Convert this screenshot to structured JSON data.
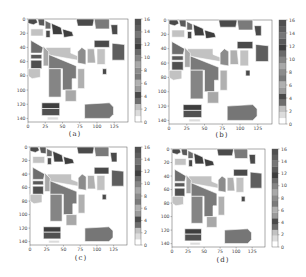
{
  "chart_data": [
    {
      "type": "heatmap",
      "title": "",
      "caption": "(a)",
      "xlabel": "",
      "ylabel": "",
      "x_ticks": [
        "0",
        "25",
        "50",
        "75",
        "100",
        "125"
      ],
      "y_ticks": [
        "0",
        "20",
        "40",
        "60",
        "80",
        "100",
        "120",
        "140"
      ],
      "xlim": [
        0,
        145
      ],
      "ylim": [
        145,
        0
      ],
      "colorbar": {
        "min": 0,
        "max": 16,
        "ticks": [
          "0",
          "2",
          "4",
          "6",
          "8",
          "10",
          "12",
          "14",
          "16"
        ]
      },
      "description": "Classification map, 145x145 pixels, 17 classes (0 = background)"
    },
    {
      "type": "heatmap",
      "caption": "(b)",
      "x_ticks": [
        "0",
        "25",
        "50",
        "75",
        "100",
        "125"
      ],
      "y_ticks": [
        "0",
        "20",
        "40",
        "60",
        "80",
        "100",
        "120",
        "140"
      ],
      "xlim": [
        0,
        145
      ],
      "ylim": [
        145,
        0
      ],
      "colorbar": {
        "min": 0,
        "max": 16,
        "ticks": [
          "0",
          "2",
          "4",
          "6",
          "8",
          "10",
          "12",
          "14",
          "16"
        ]
      }
    },
    {
      "type": "heatmap",
      "caption": "(c)",
      "x_ticks": [
        "0",
        "25",
        "50",
        "75",
        "100",
        "125"
      ],
      "y_ticks": [
        "0",
        "20",
        "40",
        "60",
        "80",
        "100",
        "120",
        "140"
      ],
      "xlim": [
        0,
        145
      ],
      "ylim": [
        145,
        0
      ],
      "colorbar": {
        "min": 0,
        "max": 16,
        "ticks": [
          "0",
          "2",
          "4",
          "6",
          "8",
          "10",
          "12",
          "14",
          "16"
        ]
      }
    },
    {
      "type": "heatmap",
      "caption": "(d)",
      "x_ticks": [
        "0",
        "25",
        "50",
        "75",
        "100",
        "125"
      ],
      "y_ticks": [
        "0",
        "20",
        "40",
        "60",
        "80",
        "100",
        "120",
        "140"
      ],
      "xlim": [
        0,
        145
      ],
      "ylim": [
        145,
        0
      ],
      "colorbar": {
        "min": 0,
        "max": 16,
        "ticks": [
          "0",
          "2",
          "4",
          "6",
          "8",
          "10",
          "12",
          "14",
          "16"
        ]
      }
    }
  ],
  "class_colors": [
    "#ffffff",
    "#dcdcdc",
    "#c2c2c2",
    "#6e6e6e",
    "#4a4a4a",
    "#9a9a9a",
    "#b0b0b0",
    "#7a7a7a",
    "#8c8c8c",
    "#a8a8a8",
    "#858585",
    "#6a6a6a",
    "#3e3e3e",
    "#5a5a5a",
    "#767676",
    "#5e5e5e",
    "#505050"
  ],
  "panels": [
    {
      "caption": "(a)"
    },
    {
      "caption": "(b)"
    },
    {
      "caption": "(c)"
    },
    {
      "caption": "(d)"
    }
  ]
}
